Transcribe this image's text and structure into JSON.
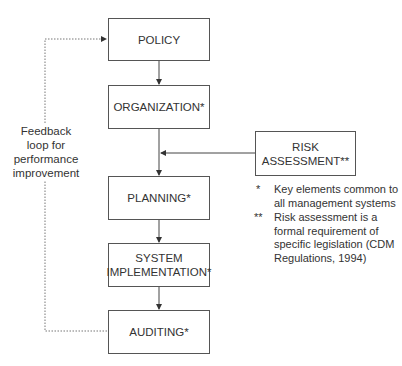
{
  "diagram": {
    "boxes": {
      "policy": "POLICY",
      "organization": "ORGANIZATION*",
      "risk_line1": "RISK",
      "risk_line2": "ASSESSMENT**",
      "planning": "PLANNING*",
      "system_line1": "SYSTEM",
      "system_line2": "IMPLEMENTATION*",
      "auditing": "AUDITING*"
    },
    "feedback_label": [
      "Feedback",
      "loop for",
      "performance",
      "improvement"
    ],
    "notes": [
      {
        "mark": "*",
        "lines": [
          "Key elements common to",
          "all management systems"
        ]
      },
      {
        "mark": "**",
        "lines": [
          "Risk assessment is a",
          "formal requirement of",
          "specific legislation (CDM",
          "Regulations, 1994)"
        ]
      }
    ]
  }
}
